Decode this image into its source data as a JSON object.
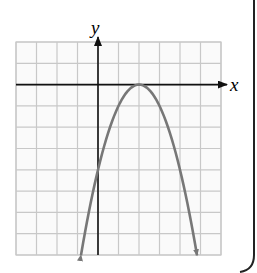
{
  "chart_data": {
    "type": "line",
    "title": "",
    "xlabel": "x",
    "ylabel": "y",
    "equation": "y = -(x - 2)^2",
    "vertex": [
      2,
      0
    ],
    "y_intercept": [
      0,
      -4
    ],
    "xlim": [
      -4,
      6
    ],
    "ylim": [
      -8,
      2
    ],
    "grid": true,
    "grid_step": 1,
    "series": [
      {
        "name": "parabola",
        "color": "#777777",
        "x": [
          -0.83,
          0,
          0.5,
          1,
          1.5,
          2,
          2.5,
          3,
          3.5,
          4,
          4.83
        ],
        "y": [
          -8,
          -4,
          -2.25,
          -1,
          -0.25,
          0,
          -0.25,
          -1,
          -2.25,
          -4,
          -8
        ]
      }
    ]
  },
  "labels": {
    "x_axis": "x",
    "y_axis": "y"
  },
  "colors": {
    "grid": "#c8c8c8",
    "axis": "#111111",
    "curve": "#777777",
    "frame": "#222222"
  }
}
